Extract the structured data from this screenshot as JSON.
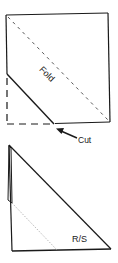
{
  "colors": {
    "line": "#1a1a1a",
    "fold_dash": "#555555",
    "dotted_guide": "#b0b0b0",
    "background": "#ffffff"
  },
  "step1": {
    "fold_label": "Fold",
    "cut_label": "Cut",
    "arrow_icon": "arrow-up-left-icon"
  },
  "step2": {
    "side_label": "R/S"
  }
}
